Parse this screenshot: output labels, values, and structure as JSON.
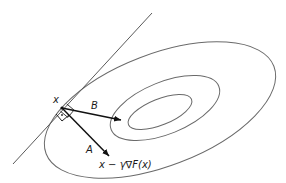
{
  "diagram": {
    "labels": {
      "point": "x",
      "vector_b": "B",
      "vector_a": "A",
      "step_result": "x − γ∇F(x)"
    },
    "colors": {
      "background": "#ffffff",
      "contour": "#6a6a6a",
      "tangent": "#5a5a5a",
      "arrow": "#111111",
      "text": "#1a1a1a"
    },
    "contours": [
      {
        "name": "outer",
        "cx": 160,
        "cy": 110,
        "rx": 122,
        "ry": 56,
        "rotate": -21
      },
      {
        "name": "middle",
        "cx": 165,
        "cy": 108,
        "rx": 58,
        "ry": 26,
        "rotate": -22
      },
      {
        "name": "inner",
        "cx": 160,
        "cy": 112,
        "rx": 34,
        "ry": 13,
        "rotate": -22
      }
    ],
    "tangent_line": {
      "x1": 13,
      "y1": 164,
      "x2": 152,
      "y2": 13
    },
    "point_x": {
      "x": 62,
      "y": 108
    },
    "arrows": [
      {
        "name": "B",
        "x1": 62,
        "y1": 108,
        "x2": 122,
        "y2": 120
      },
      {
        "name": "A",
        "x1": 62,
        "y1": 108,
        "x2": 110,
        "y2": 157
      }
    ]
  }
}
